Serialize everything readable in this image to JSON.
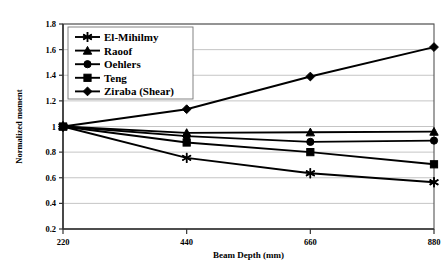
{
  "chart_data": {
    "type": "line",
    "title": "",
    "xlabel": "Beam Depth (mm)",
    "ylabel": "Normalized moment",
    "x": [
      220,
      440,
      660,
      880
    ],
    "xticklabels": [
      "220",
      "440",
      "660",
      "880"
    ],
    "yticklabels": [
      "0.2",
      "0.4",
      "0.6",
      "0.8",
      "1",
      "1.2",
      "1.4",
      "1.6",
      "1.8"
    ],
    "xlim": [
      220,
      880
    ],
    "ylim": [
      0.2,
      1.8
    ],
    "grid": "horizontal",
    "legend_position": "top-left-inside",
    "series": [
      {
        "name": "El-Mihilmy",
        "marker": "asterisk",
        "values": [
          1.0,
          0.755,
          0.635,
          0.565
        ]
      },
      {
        "name": "Raoof",
        "marker": "triangle",
        "values": [
          1.0,
          0.95,
          0.955,
          0.96
        ]
      },
      {
        "name": "Oehlers",
        "marker": "circle",
        "values": [
          1.0,
          0.925,
          0.88,
          0.89
        ]
      },
      {
        "name": "Teng",
        "marker": "square",
        "values": [
          1.0,
          0.875,
          0.8,
          0.705
        ]
      },
      {
        "name": "Ziraba (Shear)",
        "marker": "diamond",
        "values": [
          1.0,
          1.135,
          1.39,
          1.62
        ]
      }
    ]
  },
  "colors": {
    "series": "#000000",
    "grid": "#b6b6b6",
    "axis": "#333333",
    "background": "#ffffff"
  }
}
